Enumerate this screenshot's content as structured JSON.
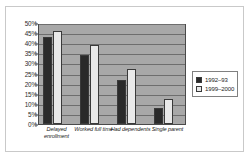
{
  "chart_data": {
    "type": "bar",
    "title": "",
    "subtitle": "",
    "xlabel": "",
    "ylabel": "",
    "ylim": [
      0,
      50
    ],
    "ytick_step": 5,
    "ytick_labels": [
      "0%",
      "5%",
      "10%",
      "15%",
      "20%",
      "25%",
      "30%",
      "35%",
      "40%",
      "45%",
      "50%"
    ],
    "grid": true,
    "legend_position": "right",
    "categories": [
      "Delayed enrollment",
      "Worked full time",
      "Had dependents",
      "Single parent"
    ],
    "series": [
      {
        "name": "1992–93",
        "color": "#2a2a2a",
        "values": [
          43,
          34,
          22,
          8
        ]
      },
      {
        "name": "1999–2000",
        "color": "#e9e9e9",
        "values": [
          46,
          39,
          27,
          12.5
        ]
      }
    ],
    "plot_background": "#a8a8a8",
    "figure_background": "#ffffff"
  }
}
